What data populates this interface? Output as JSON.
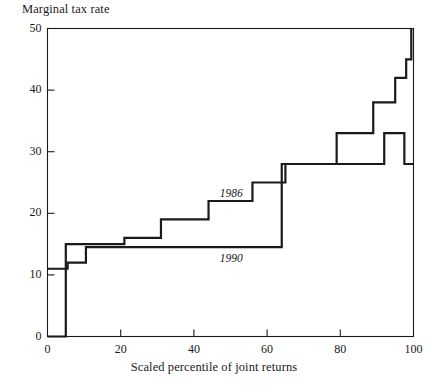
{
  "figure": {
    "background": "#ffffff",
    "ink_color": "#1a1a1a"
  },
  "chart_data": {
    "type": "line",
    "subtype": "step",
    "title": "",
    "ylabel": "Marginal tax rate",
    "xlabel": "Scaled percentile of joint returns",
    "xlim": [
      0,
      100
    ],
    "ylim": [
      0,
      50
    ],
    "xticks": [
      0,
      20,
      40,
      60,
      80,
      100
    ],
    "yticks": [
      0,
      10,
      20,
      30,
      40,
      50
    ],
    "xtick_labels": [
      "0",
      "20",
      "40",
      "60",
      "80",
      "100"
    ],
    "ytick_labels": [
      "0",
      "10",
      "20",
      "30",
      "40",
      "50"
    ],
    "grid": false,
    "legend_position": "inline-annotations",
    "frame": "box",
    "series": [
      {
        "name": "1986",
        "label": "1986",
        "line_width": 2.2,
        "style": "step-post",
        "annotation_x": 52,
        "annotation_y": 23,
        "points": [
          {
            "x": 0,
            "y": 0
          },
          {
            "x": 5,
            "y": 0
          },
          {
            "x": 5,
            "y": 15
          },
          {
            "x": 21,
            "y": 15
          },
          {
            "x": 21,
            "y": 16
          },
          {
            "x": 31,
            "y": 16
          },
          {
            "x": 31,
            "y": 19
          },
          {
            "x": 44,
            "y": 19
          },
          {
            "x": 44,
            "y": 22
          },
          {
            "x": 56,
            "y": 22
          },
          {
            "x": 56,
            "y": 25
          },
          {
            "x": 65,
            "y": 25
          },
          {
            "x": 65,
            "y": 28
          },
          {
            "x": 79,
            "y": 28
          },
          {
            "x": 79,
            "y": 33
          },
          {
            "x": 89,
            "y": 33
          },
          {
            "x": 89,
            "y": 38
          },
          {
            "x": 95,
            "y": 38
          },
          {
            "x": 95,
            "y": 42
          },
          {
            "x": 98,
            "y": 42
          },
          {
            "x": 98,
            "y": 45
          },
          {
            "x": 99.4,
            "y": 45
          },
          {
            "x": 99.4,
            "y": 50
          }
        ]
      },
      {
        "name": "1990",
        "label": "1990",
        "line_width": 2.2,
        "style": "step-post",
        "annotation_x": 52,
        "annotation_y": 12.5,
        "points": [
          {
            "x": 0,
            "y": 11
          },
          {
            "x": 5.5,
            "y": 11
          },
          {
            "x": 5.5,
            "y": 12
          },
          {
            "x": 10.5,
            "y": 12
          },
          {
            "x": 10.5,
            "y": 14.5
          },
          {
            "x": 64,
            "y": 14.5
          },
          {
            "x": 64,
            "y": 28
          },
          {
            "x": 92,
            "y": 28
          },
          {
            "x": 92,
            "y": 33
          },
          {
            "x": 97.5,
            "y": 33
          },
          {
            "x": 97.5,
            "y": 28
          },
          {
            "x": 100,
            "y": 28
          }
        ]
      }
    ]
  }
}
